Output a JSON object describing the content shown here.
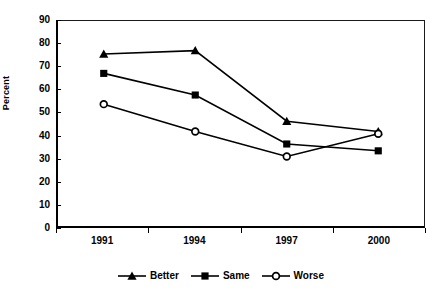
{
  "chart_data": {
    "type": "line",
    "title": "",
    "xlabel": "",
    "ylabel": "Percent",
    "categories": [
      "1991",
      "1994",
      "1997",
      "2000"
    ],
    "ylim": [
      0,
      90
    ],
    "yticks": [
      0,
      10,
      20,
      30,
      40,
      50,
      60,
      70,
      80,
      90
    ],
    "grid": false,
    "legend_position": "bottom",
    "series": [
      {
        "name": "Better",
        "marker": "triangle",
        "color": "#000000",
        "values": [
          75.5,
          77,
          46,
          41.5
        ]
      },
      {
        "name": "Same",
        "marker": "square",
        "color": "#000000",
        "values": [
          67,
          57.5,
          36,
          33
        ]
      },
      {
        "name": "Worse",
        "marker": "open-circle",
        "color": "#000000",
        "values": [
          53.5,
          41.5,
          30.5,
          40.5
        ]
      }
    ]
  },
  "axes": {
    "y_title": "Percent",
    "y_tick_labels": [
      "90",
      "80",
      "70",
      "60",
      "50",
      "40",
      "30",
      "20",
      "10",
      "0"
    ],
    "x_tick_labels": [
      "1991",
      "1994",
      "1997",
      "2000"
    ]
  },
  "legend": {
    "items": [
      {
        "label": "Better",
        "marker": "triangle-marker"
      },
      {
        "label": "Same",
        "marker": "square-marker"
      },
      {
        "label": "Worse",
        "marker": "open-circle-marker"
      }
    ]
  }
}
